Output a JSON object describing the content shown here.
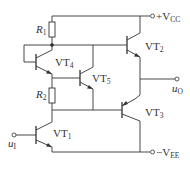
{
  "diagram": {
    "type": "circuit",
    "components": {
      "R1": {
        "label": "R",
        "sub": "1"
      },
      "R2": {
        "label": "R",
        "sub": "2"
      },
      "VT1": {
        "label": "VT",
        "sub": "1"
      },
      "VT2": {
        "label": "VT",
        "sub": "2"
      },
      "VT3": {
        "label": "VT",
        "sub": "3"
      },
      "VT4": {
        "label": "VT",
        "sub": "4"
      },
      "VT5": {
        "label": "VT",
        "sub": "5"
      }
    },
    "terminals": {
      "vcc": {
        "prefix": "+V",
        "sub": "CC"
      },
      "vee": {
        "prefix": "−V",
        "sub": "EE"
      },
      "input": {
        "label": "u",
        "sub": "I"
      },
      "output": {
        "label": "u",
        "sub": "O"
      }
    }
  }
}
